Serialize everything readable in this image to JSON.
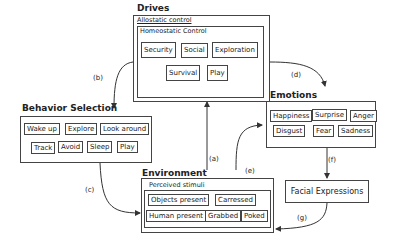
{
  "drives": {
    "title": "Drives",
    "allostatic_label": "Allostatic control",
    "homeostatic_label": "Homeostatic Control",
    "items": [
      "Security",
      "Social",
      "Exploration",
      "Survival",
      "Play"
    ]
  },
  "behavior_selection": {
    "title": "Behavior Selection",
    "items": [
      "Wake up",
      "Explore",
      "Look around",
      "Track",
      "Avoid",
      "Sleep",
      "Play"
    ]
  },
  "emotions": {
    "title": "Emotions",
    "items": [
      "Happiness",
      "Surprise",
      "Anger",
      "Disgust",
      "Fear",
      "Sadness"
    ]
  },
  "environment": {
    "title": "Environment",
    "perceived_label": "Perceived stimuli",
    "items": [
      "Objects present",
      "Carressed",
      "Human present",
      "Grabbed",
      "Poked"
    ]
  },
  "facial_expressions": {
    "title": "Facial Expressions"
  },
  "edges": {
    "a": "(a)",
    "b": "(b)",
    "c": "(c)",
    "d": "(d)",
    "e": "(e)",
    "f": "(f)",
    "g": "(g)"
  }
}
